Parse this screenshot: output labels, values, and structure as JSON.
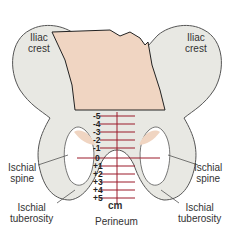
{
  "labels": {
    "iliac_left": [
      "Iliac",
      "crest"
    ],
    "iliac_right": [
      "Iliac",
      "crest"
    ],
    "spine_left": [
      "Ischial",
      "spine"
    ],
    "spine_right": [
      "Ischial",
      "spine"
    ],
    "tuberosity_left": [
      "Ischial",
      "tuberosity"
    ],
    "tuberosity_right": [
      "Ischial",
      "tuberosity"
    ],
    "perineum": "Perineum",
    "unit": "cm"
  },
  "stations": [
    "-5",
    "-4",
    "-3",
    "-2",
    "-1",
    "0",
    "+1",
    "+2",
    "+3",
    "+4",
    "+5"
  ],
  "colors": {
    "bone": "#e8e8e3",
    "bone_outline": "#555",
    "head": "#f0d5c2",
    "scale": "#9b1b2a"
  }
}
